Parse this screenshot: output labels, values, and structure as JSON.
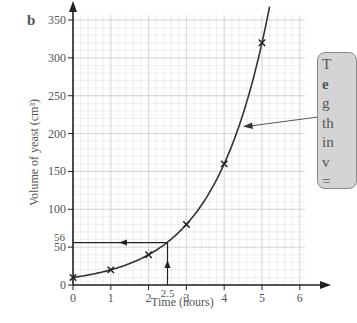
{
  "part_label": "b",
  "chart_data": {
    "type": "line",
    "title": "",
    "xlabel": "Time (hours)",
    "ylabel": "Volume of yeast (cm³)",
    "x": [
      0,
      1,
      2,
      3,
      4,
      5
    ],
    "series": [
      {
        "name": "Volume of yeast",
        "values": [
          10,
          20,
          40,
          80,
          160,
          320
        ],
        "marker": "x",
        "curve": "exponential"
      }
    ],
    "x_ticks": [
      "0",
      "1",
      "2",
      "3",
      "4",
      "5",
      "6"
    ],
    "y_ticks": [
      "0",
      "50",
      "100",
      "150",
      "200",
      "250",
      "300",
      "350"
    ],
    "xlim": [
      0,
      6
    ],
    "ylim": [
      0,
      350
    ],
    "grid": true,
    "annotations": [
      {
        "type": "reading",
        "x": 2.5,
        "y": 56,
        "x_label": "2.5",
        "y_label": "56",
        "description": "Vertical arrow up from x=2.5 to curve, horizontal arrow left to y-axis at 56"
      },
      {
        "type": "callout",
        "text_visible_lines": [
          "T",
          "e",
          "g",
          "th",
          "in",
          "v",
          "="
        ],
        "description": "Gray rounded callout box (cut off at right edge) with arrow pointing to the curve"
      }
    ]
  },
  "axes": {
    "y_ticks": [
      "350",
      "300",
      "250",
      "200",
      "150",
      "100",
      "50",
      "0"
    ],
    "x_ticks": [
      "0",
      "1",
      "2",
      "3",
      "4",
      "5",
      "6"
    ],
    "x_label": "Time (hours)",
    "y_label": "Volume of yeast (cm³)",
    "reading_x_label": "2.5",
    "reading_y_label": "56"
  },
  "callout": {
    "lines": [
      "T",
      "e",
      "g",
      "th",
      "in",
      "v",
      "="
    ]
  },
  "colors": {
    "axis": "#222222",
    "grid_minor": "#e3e3e3",
    "grid_major": "#c8c8c8",
    "curve": "#333333",
    "callout_fill": "#d4d4d4",
    "callout_border": "#8a8a8a",
    "text": "#555555"
  }
}
